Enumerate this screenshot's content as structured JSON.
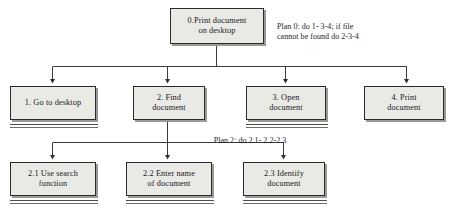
{
  "diagram": {
    "type": "hierarchical-task-analysis",
    "background_color": "#ffffff",
    "box_fill_color": "#e9e9e6",
    "box_border_color": "#2b2b2b",
    "connector_color": "#3c3c3c",
    "shadow_color": "#9a9a96"
  },
  "nodes": {
    "root": {
      "id": "0",
      "label": "0.Print document\non desktop",
      "line1": "0.Print document",
      "line2": "on desktop",
      "terminal": false,
      "level": 0
    },
    "level1": [
      {
        "id": "1",
        "label": "1. Go to desktop",
        "line1": "1. Go to desktop",
        "line2": "",
        "terminal": true,
        "level": 1
      },
      {
        "id": "2",
        "label": "2. Find\ndocument",
        "line1": "2. Find",
        "line2": "document",
        "terminal": false,
        "level": 1
      },
      {
        "id": "3",
        "label": "3. Open\ndocument",
        "line1": "3. Open",
        "line2": "document",
        "terminal": true,
        "level": 1
      },
      {
        "id": "4",
        "label": "4. Print\ndocument",
        "line1": "4. Print",
        "line2": "document",
        "terminal": false,
        "level": 1
      }
    ],
    "level2": [
      {
        "id": "2.1",
        "label": "2.1 Use search\nfunction",
        "line1": "2.1 Use search",
        "line2": "function",
        "terminal": true,
        "level": 2,
        "parent": "2"
      },
      {
        "id": "2.2",
        "label": "2.2 Enter name\nof document",
        "line1": "2.2 Enter name",
        "line2": "of document",
        "terminal": true,
        "level": 2,
        "parent": "2"
      },
      {
        "id": "2.3",
        "label": "2.3 Identify\ndocument",
        "line1": "2.3 Identify",
        "line2": "document",
        "terminal": true,
        "level": 2,
        "parent": "2"
      }
    ]
  },
  "plans": {
    "plan0": {
      "label": "Plan 0: do 1- 3-4; if file\ncannot be found do 2-3-4",
      "line1": "Plan 0: do 1- 3-4; if file",
      "line2": "cannot be found do 2-3-4",
      "applies_to": "0"
    },
    "plan2": {
      "label": "Plan 2: do 2.1- 2.2-2.3",
      "line1": "Plan 2: do 2.1- 2.2-2.3",
      "line2": "",
      "applies_to": "2"
    }
  }
}
